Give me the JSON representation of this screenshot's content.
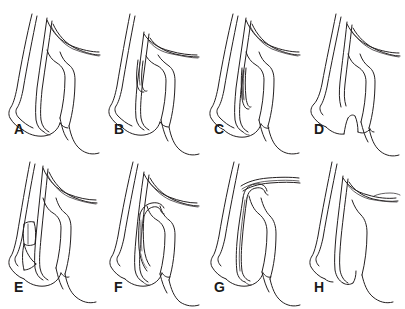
{
  "figure": {
    "type": "anatomical-line-diagram",
    "page_number": "",
    "background_color": "#ffffff",
    "line_color": "#231f20",
    "label_color": "#1a1a1a",
    "rows": 2,
    "columns": 4,
    "panel_count": 8
  },
  "panels": [
    {
      "id": "a",
      "label": "A",
      "row": 1,
      "column": 1,
      "variant": "long-inner-lumen-full-descent"
    },
    {
      "id": "b",
      "label": "B",
      "row": 1,
      "column": 2,
      "variant": "short-inner-segment-upper"
    },
    {
      "id": "c",
      "label": "C",
      "row": 1,
      "column": 3,
      "variant": "narrow-elongated-inner-channel"
    },
    {
      "id": "d",
      "label": "D",
      "row": 1,
      "column": 4,
      "variant": "notched-cleft-base"
    },
    {
      "id": "e",
      "label": "E",
      "row": 2,
      "column": 1,
      "variant": "banded-segmented-inner-body"
    },
    {
      "id": "f",
      "label": "F",
      "row": 2,
      "column": 2,
      "variant": "hooked-recurved-instrument"
    },
    {
      "id": "g",
      "label": "G",
      "row": 2,
      "column": 3,
      "variant": "upper-hook-withdrawn"
    },
    {
      "id": "h",
      "label": "H",
      "row": 2,
      "column": 4,
      "variant": "simple-open-channel"
    }
  ]
}
